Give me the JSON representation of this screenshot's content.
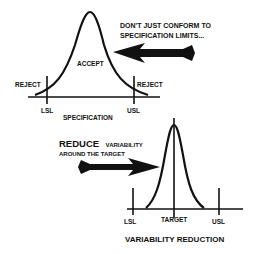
{
  "top_panel": {
    "caption_line1": "DON'T JUST CONFORM TO",
    "caption_line2": "SPECIFICATION LIMITS...",
    "accept_label": "ACCEPT",
    "reject_left": "REJECT",
    "reject_right": "REJECT",
    "lsl": "LSL",
    "usl": "USL",
    "axis_label": "SPECIFICATION"
  },
  "bottom_panel": {
    "caption_big": "REDUCE",
    "caption_rest1": "VARIABILITY",
    "caption_line2": "AROUND THE TARGET",
    "lsl": "LSL",
    "target": "TARGET",
    "usl": "USL",
    "title": "VARIABILITY REDUCTION"
  },
  "colors": {
    "ink": "#111111",
    "background": "#ffffff"
  }
}
